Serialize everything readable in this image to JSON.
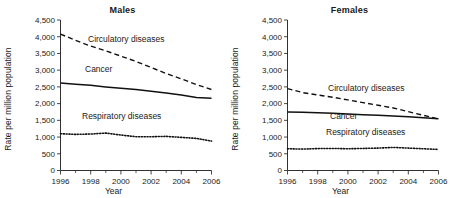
{
  "figure": {
    "panels": [
      {
        "key": "males",
        "title": "Males",
        "ylabel": "Rate per million population",
        "xlabel": "Year",
        "series_labels": {
          "circulatory": "Circulatory diseases",
          "cancer": "Cancer",
          "respiratory": "Respiratory diseases"
        }
      },
      {
        "key": "females",
        "title": "Females",
        "ylabel": "Rate per million population",
        "xlabel": "Year",
        "series_labels": {
          "circulatory": "Circulatory diseases",
          "cancer": "Cancer",
          "respiratory": "Respiratory diseases"
        }
      }
    ],
    "ytick_labels": [
      "0",
      "500",
      "1,000",
      "1,500",
      "2,000",
      "2,500",
      "3,000",
      "3,500",
      "4,000",
      "4,500"
    ],
    "xtick_labels": [
      "1996",
      "1998",
      "2000",
      "2002",
      "2004",
      "2006"
    ]
  },
  "chart_data": [
    {
      "type": "line",
      "title": "Males",
      "xlabel": "Year",
      "ylabel": "Rate per million population",
      "xlim": [
        1996,
        2006
      ],
      "ylim": [
        0,
        4500
      ],
      "yticks": [
        0,
        500,
        1000,
        1500,
        2000,
        2500,
        3000,
        3500,
        4000,
        4500
      ],
      "xticks": [
        1996,
        1998,
        2000,
        2002,
        2004,
        2006
      ],
      "xticks_minor": [
        1997,
        1999,
        2001,
        2003,
        2005
      ],
      "grid": false,
      "legend": "inline-labels",
      "x": [
        1996,
        1997,
        1998,
        1999,
        2000,
        2001,
        2002,
        2003,
        2004,
        2005,
        2006
      ],
      "series": [
        {
          "name": "Circulatory diseases",
          "style": "dashed",
          "values": [
            4080,
            3890,
            3720,
            3580,
            3420,
            3260,
            3080,
            2900,
            2740,
            2570,
            2420
          ]
        },
        {
          "name": "Cancer",
          "style": "solid",
          "values": [
            2620,
            2580,
            2550,
            2500,
            2460,
            2420,
            2370,
            2320,
            2260,
            2180,
            2160
          ]
        },
        {
          "name": "Respiratory diseases",
          "style": "dotted",
          "values": [
            1100,
            1080,
            1090,
            1120,
            1060,
            1010,
            1010,
            1020,
            990,
            960,
            880
          ]
        }
      ]
    },
    {
      "type": "line",
      "title": "Females",
      "xlabel": "Year",
      "ylabel": "Rate per million population",
      "xlim": [
        1996,
        2006
      ],
      "ylim": [
        0,
        4500
      ],
      "yticks": [
        0,
        500,
        1000,
        1500,
        2000,
        2500,
        3000,
        3500,
        4000,
        4500
      ],
      "xticks": [
        1996,
        1998,
        2000,
        2002,
        2004,
        2006
      ],
      "xticks_minor": [
        1997,
        1999,
        2001,
        2003,
        2005
      ],
      "grid": false,
      "legend": "inline-labels",
      "x": [
        1996,
        1997,
        1998,
        1999,
        2000,
        2001,
        2002,
        2003,
        2004,
        2005,
        2006
      ],
      "series": [
        {
          "name": "Circulatory diseases",
          "style": "dashed",
          "values": [
            2450,
            2330,
            2260,
            2190,
            2110,
            2030,
            1950,
            1870,
            1760,
            1650,
            1540
          ]
        },
        {
          "name": "Cancer",
          "style": "solid",
          "values": [
            1750,
            1740,
            1730,
            1710,
            1690,
            1670,
            1650,
            1630,
            1610,
            1580,
            1550
          ]
        },
        {
          "name": "Respiratory diseases",
          "style": "dotted",
          "values": [
            650,
            640,
            655,
            660,
            650,
            660,
            670,
            690,
            670,
            650,
            630
          ]
        }
      ]
    }
  ]
}
